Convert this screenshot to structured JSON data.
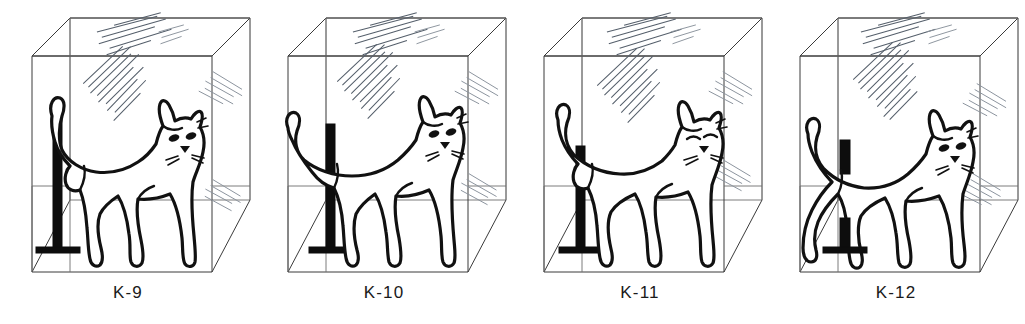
{
  "figure": {
    "kind": "line-drawing-plate",
    "background_color": "#ffffff",
    "ink_color": "#111111",
    "box_edge_color": "#3a3a3a",
    "post_color": "#0d0d0d",
    "reflection_color": "#555f6b",
    "panel_count": 4
  },
  "panels": [
    {
      "id": "K-9",
      "label": "K-9",
      "subject": "cat",
      "object": "scratching-post",
      "container": "transparent-cube-box",
      "cat_facing": "right",
      "cat_position": "left-of-center, tail raised and curled over post",
      "post_position": "left, fully visible in front of cat hind leg",
      "post_visible": "full",
      "tail": "raised-curved-left",
      "head_pose": "three-quarter-right",
      "reflections": 4
    },
    {
      "id": "K-10",
      "label": "K-10",
      "subject": "cat",
      "object": "scratching-post",
      "container": "transparent-cube-box",
      "cat_facing": "right",
      "cat_position": "right-of-post, tail sweeping left across the post",
      "post_position": "left-center, cat tail crosses in front",
      "post_visible": "full",
      "tail": "raised-sweeping-left",
      "head_pose": "three-quarter-right",
      "reflections": 4
    },
    {
      "id": "K-11",
      "label": "K-11",
      "subject": "cat",
      "object": "scratching-post",
      "container": "transparent-cube-box",
      "cat_facing": "right",
      "cat_position": "center, body turned more toward viewer",
      "post_position": "left, cat hind leg overlaps post base",
      "post_visible": "full",
      "tail": "raised-hooked-left",
      "head_pose": "frontal-right",
      "reflections": 4
    },
    {
      "id": "K-12",
      "label": "K-12",
      "subject": "cat",
      "object": "scratching-post",
      "container": "transparent-cube-box",
      "cat_facing": "right",
      "cat_position": "center, body covers middle of post",
      "post_position": "behind cat body; only top and base visible",
      "post_visible": "partial",
      "tail": "raised-curved-left",
      "head_pose": "three-quarter-right",
      "reflections": 4
    }
  ],
  "box": {
    "description": "transparent cube drawn in parallel perspective with visible back and side panels",
    "visible_faces": [
      "front",
      "top",
      "left",
      "right",
      "floor",
      "back"
    ],
    "reflection_marks": "sparse diagonal hatch clusters on glass panes"
  }
}
